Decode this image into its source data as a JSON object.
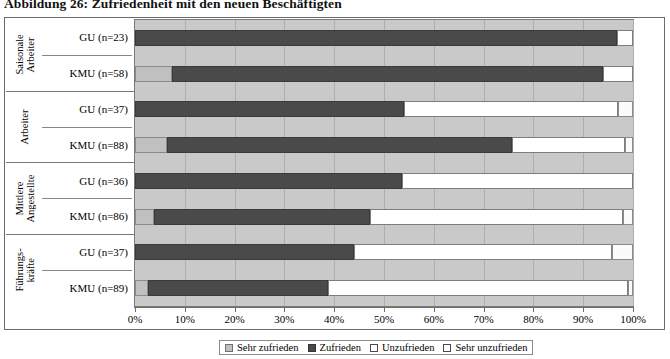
{
  "title": "Abbildung 26: Zufriedenheit mit den neuen Beschäftigten",
  "chart_data": {
    "type": "bar",
    "orientation": "horizontal",
    "stacked": true,
    "normalized": "100%",
    "title": "Abbildung 26: Zufriedenheit mit den neuen Beschäftigten",
    "xlabel": "",
    "ylabel": "",
    "xlim": [
      0,
      100
    ],
    "xticks": [
      0,
      10,
      20,
      30,
      40,
      50,
      60,
      70,
      80,
      90,
      100
    ],
    "xtick_labels": [
      "0%",
      "10%",
      "20%",
      "30%",
      "40%",
      "50%",
      "60%",
      "70%",
      "80%",
      "90%",
      "100%"
    ],
    "grid": true,
    "legend_position": "bottom",
    "legend": [
      "Sehr zufrieden",
      "Zufrieden",
      "Unzufrieden",
      "Sehr unzufrieden"
    ],
    "series": [
      {
        "name": "Sehr zufrieden",
        "values": [
          0.0,
          7.5,
          0.0,
          6.4,
          0.0,
          3.9,
          0.0,
          2.6
        ]
      },
      {
        "name": "Zufrieden",
        "values": [
          96.8,
          86.5,
          54.0,
          69.4,
          53.6,
          43.3,
          44.0,
          36.2
        ]
      },
      {
        "name": "Unzufrieden",
        "values": [
          3.2,
          6.0,
          43.0,
          22.6,
          46.4,
          50.8,
          51.8,
          60.3
        ]
      },
      {
        "name": "Sehr unzufrieden",
        "values": [
          0.0,
          0.0,
          3.0,
          1.6,
          0.0,
          2.0,
          4.2,
          0.9
        ]
      }
    ],
    "groups": [
      {
        "name": "Saisonale\nArbeiter",
        "rows": [
          {
            "label": "GU (n=23)",
            "segments": [
              0.0,
              96.8,
              3.2,
              0.0
            ]
          },
          {
            "label": "KMU (n=58)",
            "segments": [
              7.5,
              86.5,
              6.0,
              0.0
            ]
          }
        ]
      },
      {
        "name": "Arbeiter",
        "rows": [
          {
            "label": "GU (n=37)",
            "segments": [
              0.0,
              54.0,
              43.0,
              3.0
            ]
          },
          {
            "label": "KMU (n=88)",
            "segments": [
              6.4,
              69.4,
              22.6,
              1.6
            ]
          }
        ]
      },
      {
        "name": "Mittlere\nAngestellte",
        "rows": [
          {
            "label": "GU (n=36)",
            "segments": [
              0.0,
              53.6,
              46.4,
              0.0
            ]
          },
          {
            "label": "KMU (n=86)",
            "segments": [
              3.9,
              43.3,
              50.8,
              2.0
            ]
          }
        ]
      },
      {
        "name": "Führungs-\nkräfte",
        "rows": [
          {
            "label": "GU (n=37)",
            "segments": [
              0.0,
              44.0,
              51.8,
              4.2
            ]
          },
          {
            "label": "KMU (n=89)",
            "segments": [
              2.6,
              36.2,
              60.3,
              0.9
            ]
          }
        ]
      }
    ]
  },
  "colors": {
    "sehr_zufrieden": "#c0c0c0",
    "zufrieden": "#4a4a4a",
    "unzufrieden": "#ffffff",
    "sehr_unzufrieden": "#ffffff",
    "plot_background": "#c9c9c9",
    "grid": "#aeaeae",
    "frame": "#6b6b6b"
  }
}
